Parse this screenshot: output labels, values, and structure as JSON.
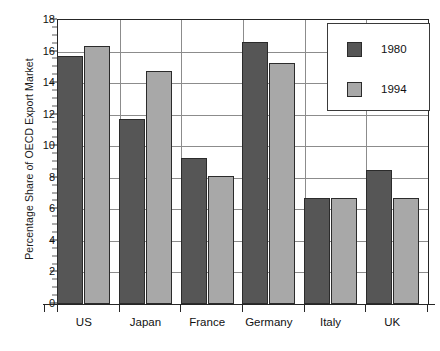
{
  "chart_data": {
    "type": "bar",
    "title": "",
    "subtitle": "",
    "xlabel": "",
    "ylabel": "Percentage Share of OECD Export Market",
    "categories": [
      "US",
      "Japan",
      "France",
      "Germany",
      "Italy",
      "UK"
    ],
    "series": [
      {
        "name": "1980",
        "color": "#565656",
        "values": [
          15.7,
          11.7,
          9.25,
          16.6,
          6.7,
          8.5
        ]
      },
      {
        "name": "1994",
        "color": "#a8a8a8",
        "values": [
          16.35,
          14.8,
          8.1,
          15.3,
          6.7,
          6.75
        ]
      }
    ],
    "ylim": [
      0,
      18
    ],
    "ytick_labels": [
      "0",
      "2",
      "4",
      "6",
      "8",
      "10",
      "12",
      "14",
      "16",
      "18"
    ],
    "ytick_values": [
      0,
      2,
      4,
      6,
      8,
      10,
      12,
      14,
      16,
      18
    ],
    "ytick_minor_step": 0.5,
    "grid": {
      "horizontal": true,
      "vertical": true
    },
    "legend": {
      "position": "top-right",
      "entries": [
        "1980",
        "1994"
      ]
    },
    "annotations": []
  }
}
